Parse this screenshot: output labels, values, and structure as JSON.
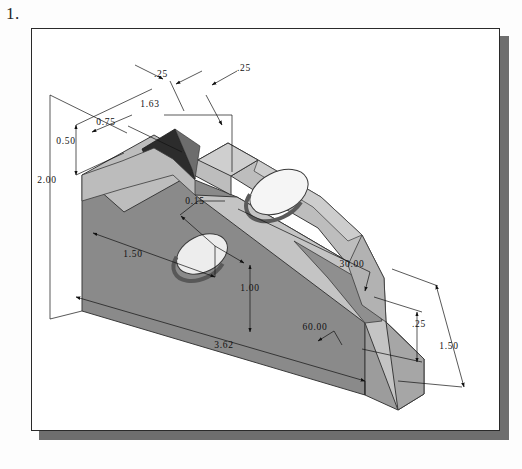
{
  "page": {
    "problem_number": "1.",
    "background_color": "#ffffff",
    "frame_border_color": "#2a2a2a",
    "frame_shadow_color": "#6e6e6e"
  },
  "figure": {
    "projection": "isometric",
    "object_type": "solid-model-shaded",
    "shading": {
      "top_face_color": "#b9b9b9",
      "front_face_color": "#8a8a8a",
      "right_face_color": "#9e9e9e",
      "chamfer_face_color": "#c9c9c9",
      "slot_recess_color": "#2d2d2d",
      "hole_highlight_color": "#f2f2f2",
      "hole_shadow_color": "#6b6b6b",
      "outline_color": "#3a3a3a"
    },
    "dimensions": [
      {
        "id": "d-top-left-25",
        "label": ".25",
        "kind": "linear",
        "x": 161,
        "y": 76
      },
      {
        "id": "d-top-right-25",
        "label": ".25",
        "kind": "linear",
        "x": 244,
        "y": 70
      },
      {
        "id": "d-163",
        "label": "1.63",
        "kind": "linear",
        "x": 150,
        "y": 104
      },
      {
        "id": "d-075",
        "label": "0.75",
        "kind": "linear",
        "x": 106,
        "y": 122
      },
      {
        "id": "d-050",
        "label": "0.50",
        "kind": "linear",
        "x": 66,
        "y": 141
      },
      {
        "id": "d-200",
        "label": "2.00",
        "kind": "linear",
        "x": 47,
        "y": 180
      },
      {
        "id": "d-015",
        "label": "0.15",
        "kind": "diameter",
        "x": 195,
        "y": 201
      },
      {
        "id": "d-150-left",
        "label": "1.50",
        "kind": "linear",
        "x": 133,
        "y": 254
      },
      {
        "id": "d-100",
        "label": "1.00",
        "kind": "linear",
        "x": 250,
        "y": 288
      },
      {
        "id": "d-362",
        "label": "3.62",
        "kind": "linear",
        "x": 224,
        "y": 345
      },
      {
        "id": "d-3000",
        "label": "30.00",
        "kind": "angle",
        "x": 352,
        "y": 264
      },
      {
        "id": "d-6000",
        "label": "60.00",
        "kind": "angle",
        "x": 315,
        "y": 327
      },
      {
        "id": "d-right-25",
        "label": ".25",
        "kind": "linear",
        "x": 419,
        "y": 324
      },
      {
        "id": "d-150-right",
        "label": "1.50",
        "kind": "linear",
        "x": 449,
        "y": 346
      }
    ]
  }
}
